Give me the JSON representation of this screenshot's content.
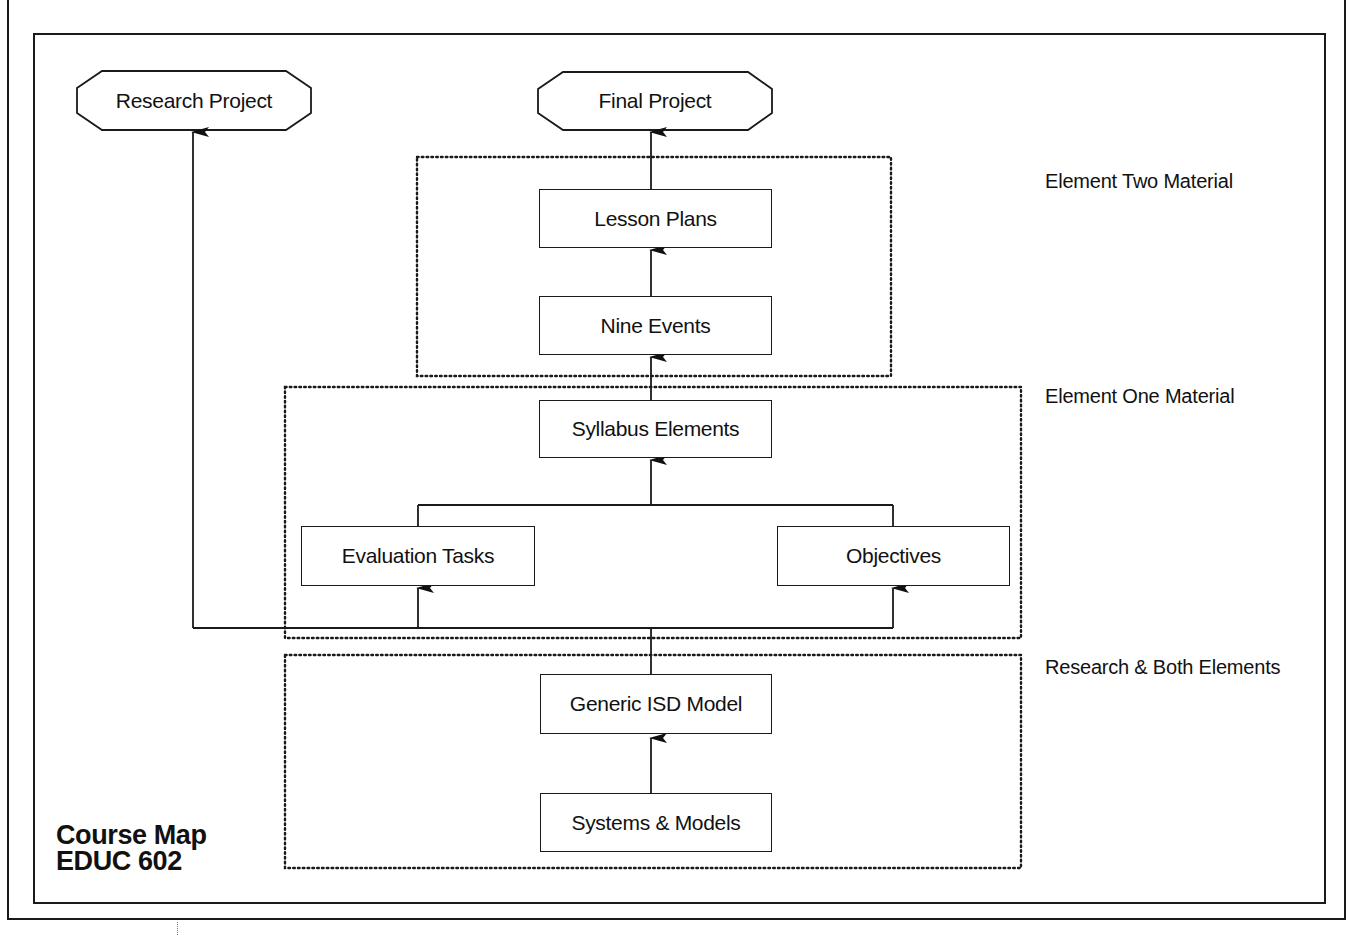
{
  "diagram": {
    "title": {
      "line1": "Course Map",
      "line2": "EDUC 602"
    },
    "terminals": {
      "research_project": "Research Project",
      "final_project": "Final Project"
    },
    "boxes": {
      "lesson_plans": "Lesson Plans",
      "nine_events": "Nine Events",
      "syllabus_elements": "Syllabus Elements",
      "evaluation_tasks": "Evaluation Tasks",
      "objectives": "Objectives",
      "generic_isd_model": "Generic ISD Model",
      "systems_models": "Systems & Models"
    },
    "groups": {
      "element_two": "Element Two Material",
      "element_one": "Element One Material",
      "research_both": "Research & Both Elements"
    },
    "edges": [
      {
        "from": "Systems & Models",
        "to": "Generic ISD Model"
      },
      {
        "from": "Generic ISD Model",
        "to": "Evaluation Tasks"
      },
      {
        "from": "Generic ISD Model",
        "to": "Objectives"
      },
      {
        "from": "Generic ISD Model",
        "to": "Research Project"
      },
      {
        "from": "Evaluation Tasks",
        "to": "Syllabus Elements"
      },
      {
        "from": "Objectives",
        "to": "Syllabus Elements"
      },
      {
        "from": "Syllabus Elements",
        "to": "Nine Events"
      },
      {
        "from": "Nine Events",
        "to": "Lesson Plans"
      },
      {
        "from": "Lesson Plans",
        "to": "Final Project"
      }
    ],
    "colors": {
      "line": "#1a1a1a",
      "background": "#ffffff"
    }
  }
}
